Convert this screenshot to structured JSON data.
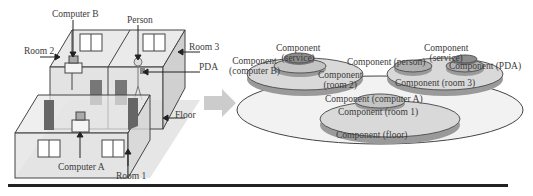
{
  "left_figure": {
    "labels": {
      "computer_b": "Computer B",
      "person": "Person",
      "room2": "Room 2",
      "room3": "Room 3",
      "pda": "PDA",
      "floor": "Floor",
      "computer_a": "Computer A",
      "room1": "Room 1"
    }
  },
  "arrow": {
    "icon": "right-arrow-icon",
    "color": "#cccccc"
  },
  "right_figure": {
    "labels": {
      "service_left": [
        "Component",
        "(service)"
      ],
      "computer_b": [
        "Component",
        "(computer B)"
      ],
      "room2": [
        "Component",
        "(room 2)"
      ],
      "person": "Component (person)",
      "service_right": [
        "Component",
        "(service)"
      ],
      "pda": "Component (PDA)",
      "room3": "Component (room 3)",
      "computer_a": "Component (computer A)",
      "room1": "Component (room 1)",
      "floor": "Component (floor)"
    },
    "colors": {
      "floor_fill": "#f2f2f2",
      "room_fill": "#d9d9d9",
      "room_shadow": "#9a9a9a",
      "device_fill": "#8c8c8c"
    }
  }
}
